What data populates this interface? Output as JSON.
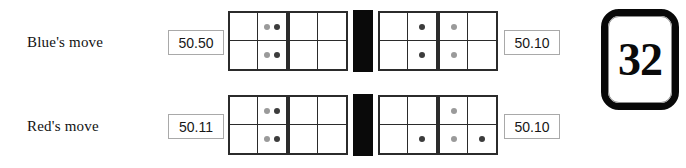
{
  "figure": {
    "rows": [
      {
        "id": "blue-move",
        "label": "Blue's move",
        "left_value": "50.50",
        "right_value": "50.10",
        "grids": [
          {
            "id": "grid-1",
            "cells": [
              {
                "position": "top-left",
                "dots": []
              },
              {
                "position": "top-right",
                "dots": [
                  "light",
                  "dark"
                ]
              },
              {
                "position": "bottom-left",
                "dots": []
              },
              {
                "position": "bottom-right",
                "dots": [
                  "light",
                  "dark"
                ]
              }
            ]
          },
          {
            "id": "grid-2",
            "cells": [
              {
                "position": "top-left",
                "dots": []
              },
              {
                "position": "top-right",
                "dots": []
              },
              {
                "position": "bottom-left",
                "dots": []
              },
              {
                "position": "bottom-right",
                "dots": []
              }
            ]
          },
          {
            "id": "grid-3",
            "cells": [
              {
                "position": "top-left",
                "dots": []
              },
              {
                "position": "top-right",
                "dots": [
                  "dark"
                ]
              },
              {
                "position": "bottom-left",
                "dots": []
              },
              {
                "position": "bottom-right",
                "dots": [
                  "dark"
                ]
              }
            ]
          },
          {
            "id": "grid-4",
            "cells": [
              {
                "position": "top-left",
                "dots": [
                  "light"
                ]
              },
              {
                "position": "top-right",
                "dots": []
              },
              {
                "position": "bottom-left",
                "dots": [
                  "light"
                ]
              },
              {
                "position": "bottom-right",
                "dots": []
              }
            ]
          }
        ]
      },
      {
        "id": "red-move",
        "label": "Red's move",
        "left_value": "50.11",
        "right_value": "50.10",
        "grids": [
          {
            "id": "grid-1",
            "cells": [
              {
                "position": "top-left",
                "dots": []
              },
              {
                "position": "top-right",
                "dots": [
                  "light",
                  "dark"
                ]
              },
              {
                "position": "bottom-left",
                "dots": []
              },
              {
                "position": "bottom-right",
                "dots": [
                  "light",
                  "dark"
                ]
              }
            ]
          },
          {
            "id": "grid-2",
            "cells": [
              {
                "position": "top-left",
                "dots": []
              },
              {
                "position": "top-right",
                "dots": []
              },
              {
                "position": "bottom-left",
                "dots": []
              },
              {
                "position": "bottom-right",
                "dots": []
              }
            ]
          },
          {
            "id": "grid-3",
            "cells": [
              {
                "position": "top-left",
                "dots": []
              },
              {
                "position": "top-right",
                "dots": []
              },
              {
                "position": "bottom-left",
                "dots": []
              },
              {
                "position": "bottom-right",
                "dots": [
                  "dark"
                ]
              }
            ]
          },
          {
            "id": "grid-4",
            "cells": [
              {
                "position": "top-left",
                "dots": [
                  "light"
                ]
              },
              {
                "position": "top-right",
                "dots": []
              },
              {
                "position": "bottom-left",
                "dots": [
                  "light"
                ]
              },
              {
                "position": "bottom-right",
                "dots": [
                  "dark"
                ]
              }
            ]
          }
        ]
      }
    ],
    "number_card": {
      "value": "32"
    },
    "colors": {
      "dot_dark": "#3c3c3c",
      "dot_light": "#9a9a9a",
      "grid_line": "#2b2b2b",
      "separator": "#0a0a0a",
      "box_border": "#a9a9a9"
    },
    "layout": {
      "grid_left_offsets": [
        228,
        288,
        378,
        438
      ],
      "separator_left": 353,
      "grid_size": 60
    }
  }
}
